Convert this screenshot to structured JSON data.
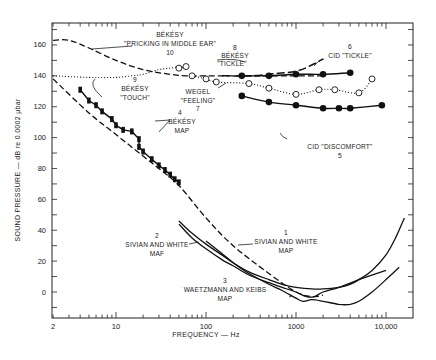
{
  "chart_data": {
    "type": "line",
    "title": "",
    "xlabel": "FREQUENCY — Hz",
    "ylabel": "SOUND PRESSURE — dB re 0.0002 μbar",
    "xscale": "log",
    "xlim": [
      2,
      16000
    ],
    "ylim": [
      -16,
      173
    ],
    "x_tick_labels": [
      "2",
      "10",
      "100",
      "1000",
      "10,000"
    ],
    "x_tick_values": [
      2,
      10,
      100,
      1000,
      10000
    ],
    "y_tick_labels": [
      "0",
      "20",
      "40",
      "60",
      "80",
      "100",
      "120",
      "140",
      "160"
    ],
    "y_tick_values": [
      0,
      20,
      40,
      60,
      80,
      100,
      120,
      140,
      160
    ],
    "grid": false,
    "legend": "none (curves labeled inline)",
    "series": [
      {
        "id": 1,
        "name": "SIVIAN AND WHITE MAP",
        "number": "1",
        "style": "solid",
        "x": [
          50,
          70,
          100,
          150,
          200,
          300,
          500,
          700,
          1000,
          1500,
          2000,
          3000,
          4000,
          5000,
          7000,
          10000,
          13000,
          16000
        ],
        "y": [
          46,
          38,
          31,
          24,
          19,
          13,
          8,
          5,
          3,
          2,
          2,
          3,
          5,
          8,
          14,
          24,
          36,
          48
        ]
      },
      {
        "id": 2,
        "name": "SIVIAN AND WHITE MAF",
        "number": "2",
        "style": "solid",
        "x": [
          50,
          70,
          100,
          150,
          200,
          300,
          500,
          700,
          1000,
          1300,
          1600,
          2000,
          3000,
          5000,
          10000
        ],
        "y": [
          44,
          35,
          28,
          21,
          17,
          11,
          6,
          3,
          0,
          -3,
          -3,
          0,
          3,
          8,
          14
        ]
      },
      {
        "id": 3,
        "name": "WAETZMANN AND KEIBS MAP",
        "number": "3",
        "style": "solid",
        "x": [
          100,
          150,
          200,
          300,
          500,
          700,
          1000,
          1200,
          1500,
          2000,
          3000,
          4000,
          5000,
          7000,
          10000,
          14000
        ],
        "y": [
          33,
          25,
          19,
          12,
          5,
          1,
          -4,
          -6,
          -5,
          -6,
          -8,
          -8,
          -6,
          0,
          8,
          16
        ]
      },
      {
        "id": "extrapolation",
        "name": "Dashed extrapolation of threshold",
        "style": "dashed",
        "x": [
          2,
          5,
          10,
          20,
          30,
          50,
          100,
          200,
          500,
          1000,
          1500,
          2000
        ],
        "y": [
          138,
          116,
          102,
          88,
          80,
          69,
          48,
          30,
          12,
          0,
          -3,
          -2
        ]
      },
      {
        "id": 4,
        "name": "BÉKÉSY MAP",
        "number": "4",
        "style": "solid with filled markers",
        "x": [
          4,
          5,
          6,
          7,
          9,
          10,
          12,
          15,
          18,
          18,
          20,
          25,
          30,
          35,
          40,
          45,
          50
        ],
        "y": [
          131,
          124,
          121,
          117,
          112,
          108,
          105,
          104,
          99,
          94,
          91,
          86,
          82,
          79,
          76,
          73,
          71
        ]
      },
      {
        "id": 5,
        "name": "CID \"DISCOMFORT\"",
        "number": "5",
        "style": "solid with filled circles",
        "x": [
          250,
          500,
          1000,
          2000,
          3000,
          4000,
          9000
        ],
        "y": [
          127,
          123,
          121,
          119,
          119,
          119,
          121
        ]
      },
      {
        "id": 6,
        "name": "CID \"TICKLE\"",
        "number": "6",
        "style": "solid with filled circles",
        "x": [
          250,
          500,
          1000,
          2000,
          4000
        ],
        "y": [
          140,
          140,
          141,
          141,
          142
        ]
      },
      {
        "id": 7,
        "name": "WEGEL \"FEELING\"",
        "number": "7",
        "style": "dotted with open circles",
        "x": [
          70,
          100,
          130,
          300,
          500,
          1000,
          1800,
          2700,
          5000,
          7000
        ],
        "y": [
          140,
          138,
          136,
          135,
          132,
          128,
          131,
          131,
          129,
          138
        ]
      },
      {
        "id": 8,
        "name": "BÉKÉSY \"TICKLE\"",
        "number": "8",
        "style": "long-dashed",
        "x": [
          150,
          300,
          500,
          1000,
          1500,
          2000
        ],
        "y": [
          140,
          140,
          141,
          143,
          147,
          151
        ]
      },
      {
        "id": 9,
        "name": "BÉKÉSY \"TOUCH\"",
        "number": "9",
        "style": "dotted",
        "x": [
          2,
          5,
          10,
          15,
          20,
          30,
          40,
          50
        ],
        "y": [
          140,
          139,
          139,
          140,
          141,
          144,
          145,
          146
        ]
      },
      {
        "id": 10,
        "name": "BÉKÉSY \"PRICKING IN MIDDLE EAR\"",
        "number": "10",
        "style": "dashed",
        "x": [
          2,
          3,
          5,
          10,
          20,
          40,
          60,
          100,
          200,
          500,
          1000,
          2000
        ],
        "y": [
          163,
          163,
          158,
          150,
          144,
          141,
          140,
          140,
          140,
          140,
          140,
          140
        ]
      },
      {
        "id": "10-open",
        "name": "BÉKÉSY open-circle points",
        "style": "dotted with open circles",
        "x": [
          50,
          60
        ],
        "y": [
          145,
          146
        ]
      }
    ],
    "annotations": [
      {
        "text": "BÉKÉSY \"PRICKING IN MIDDLE EAR\" 10"
      },
      {
        "text": "9 BÉKÉSY \"TOUCH\""
      },
      {
        "text": "8 BÉKÉSY \"TICKLE\""
      },
      {
        "text": "6 CID \"TICKLE\""
      },
      {
        "text": "WEGEL \"FEELING\" 7"
      },
      {
        "text": "CID \"DISCOMFORT\" 5"
      },
      {
        "text": "4 BÉKÉSY MAP"
      },
      {
        "text": "2 SIVIAN AND WHITE MAF"
      },
      {
        "text": "1 SIVIAN AND WHITE MAP"
      },
      {
        "text": "3 WAETZMANN AND KEIBS MAP"
      }
    ]
  },
  "labels": {
    "xlabel": "FREQUENCY — Hz",
    "ylabel": "SOUND PRESSURE — dB re 0.0002 μbar",
    "x_ticks": [
      "2",
      "10",
      "100",
      "1000",
      "10,000"
    ],
    "y_ticks": [
      "0",
      "20",
      "40",
      "60",
      "80",
      "100",
      "120",
      "140",
      "160"
    ],
    "c10_title": "BÉKÉSY",
    "c10_sub": "\"PRICKING IN MIDDLE EAR\"",
    "c10_num": "10",
    "c9_num": "9",
    "c9_title": "BÉKÉSY",
    "c9_sub": "\"TOUCH\"",
    "c8_num": "8",
    "c8_title": "BÉKÉSY",
    "c8_sub": "\"TICKLE\"",
    "c6_num": "6",
    "c6_title": "CID \"TICKLE\"",
    "c7_title": "WEGEL",
    "c7_sub": "\"FEELING\"",
    "c7_num": "7",
    "c5_title": "CID \"DISCOMFORT\"",
    "c5_num": "5",
    "c4_num": "4",
    "c4_title": "BÉKÉSY",
    "c4_sub": "MAP",
    "c2_num": "2",
    "c2_title": "SIVIAN AND WHITE",
    "c2_sub": "MAF",
    "c1_num": "1",
    "c1_title": "SIVIAN AND WHITE",
    "c1_sub": "MAP",
    "c3_num": "3",
    "c3_title": "WAETZMANN AND KEIBS",
    "c3_sub": "MAP"
  }
}
